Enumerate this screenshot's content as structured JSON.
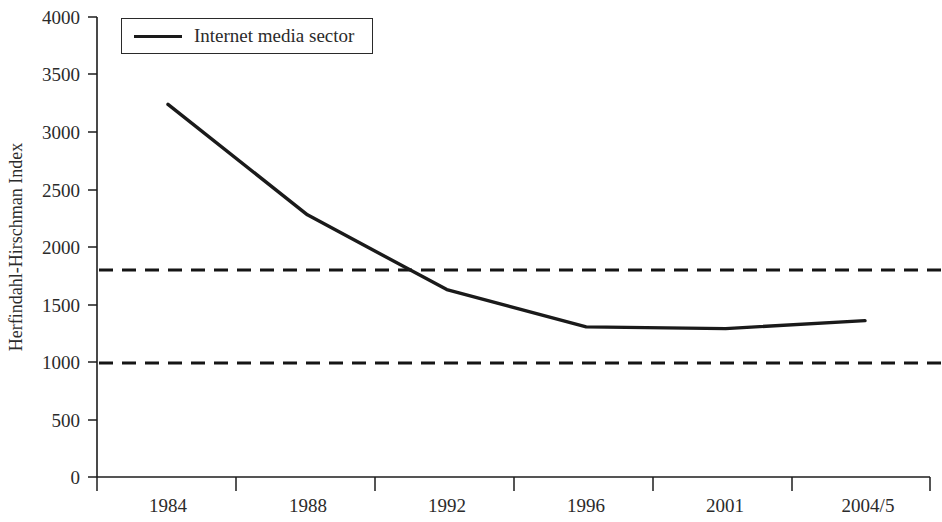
{
  "chart_data": {
    "type": "line",
    "title": "",
    "xlabel": "",
    "ylabel": "Herfindahl-Hirschman Index",
    "categories": [
      "1984",
      "1988",
      "1992",
      "1996",
      "2001",
      "2004/5"
    ],
    "series": [
      {
        "name": "Internet media sector",
        "values": [
          3240,
          2280,
          1630,
          1305,
          1290,
          1360
        ]
      }
    ],
    "ylim": [
      0,
      4000
    ],
    "y_ticks": [
      0,
      500,
      1000,
      1500,
      2000,
      2500,
      3000,
      3500,
      4000
    ],
    "y_tick_labels": [
      "0",
      "500",
      "1000",
      "1500",
      "2000",
      "2500",
      "3000",
      "3500",
      "4000"
    ],
    "grid": false,
    "legend_position": "top-left",
    "reference_lines": [
      {
        "value": 1800,
        "style": "dashed",
        "label": ""
      },
      {
        "value": 1000,
        "style": "dashed",
        "label": ""
      }
    ],
    "colors": {
      "series": "#1a1a1a",
      "reference": "#151515",
      "axis": "#1c1c1c",
      "background": "#ffffff"
    }
  },
  "legend": {
    "entries": [
      {
        "label": "Internet media sector",
        "swatch": "line-swatch"
      }
    ]
  },
  "axes": {
    "y_title": "Herfindahl-Hirschman Index",
    "y_labels": {
      "t0": "4000",
      "t1": "3500",
      "t2": "3000",
      "t3": "2500",
      "t4": "2000",
      "t5": "1500",
      "t6": "1000",
      "t7": "500",
      "t8": "0"
    },
    "x_labels": {
      "c0": "1984",
      "c1": "1988",
      "c2": "1992",
      "c3": "1996",
      "c4": "2001",
      "c5": "2004/5"
    }
  }
}
